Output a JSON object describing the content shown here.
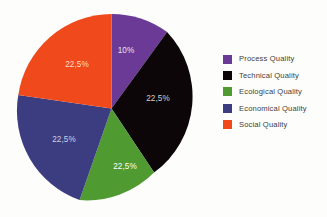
{
  "chart_data": {
    "type": "pie",
    "title": "",
    "subtitle": "",
    "xlabel": "",
    "ylabel": "",
    "grid": false,
    "legend_position": "right",
    "start_angle_deg": 0,
    "direction": "clockwise",
    "categories": [
      "Process Quality",
      "Technical Quality",
      "Ecological Quality",
      "Economical Quality",
      "Social Quality"
    ],
    "values": [
      10,
      22.5,
      22.5,
      22.5,
      22.5
    ],
    "value_unit": "%",
    "data_labels": [
      "10%",
      "22,5%",
      "22,5%",
      "22,5%",
      "22,5%"
    ],
    "colors": [
      "#6b3a96",
      "#0c0608",
      "#4f9a31",
      "#3c3c80",
      "#f04a1c"
    ],
    "label_colors": [
      "#e8e2ee",
      "#cfcfcf",
      "#ffffff",
      "#cfd0e4",
      "#ffd9c8"
    ],
    "slices": [
      {
        "name": "Process Quality",
        "label": "10%",
        "value": 10,
        "color": "#6b3a96",
        "label_color": "#e8e2ee",
        "path": "M 96.5 97.5 L 96.5 2.9 A 94.6 94.6 0 0 1 152.1 20.9 Z",
        "label_x": 111,
        "label_y": 42
      },
      {
        "name": "Technical Quality",
        "label": "22,5%",
        "value": 22.5,
        "color": "#0c0608",
        "label_color": "#cfcfcf",
        "path": "M 96.5 97.5 L 152.1 20.9 A 94.6 94.6 0 0 1 139.1 161.6 Z",
        "label_x": 143,
        "label_y": 90
      },
      {
        "name": "Ecological Quality",
        "label": "22,5%",
        "value": 22.5,
        "color": "#4f9a31",
        "label_color": "#ffffff",
        "path": "M 96.5 97.5 L 139.1 161.6 A 94.6 94.6 0 0 1 64.6 189.1 Z",
        "label_x": 110,
        "label_y": 158
      },
      {
        "name": "Economical Quality",
        "label": "22,5%",
        "value": 22.5,
        "color": "#3c3c80",
        "label_color": "#cfd0e4",
        "path": "M 96.5 97.5 L 64.6 189.1 A 94.6 94.6 0 0 1 3.3 84.0 Z",
        "label_x": 49,
        "label_y": 131
      },
      {
        "name": "Social Quality",
        "label": "22,5%",
        "value": 22.5,
        "color": "#f04a1c",
        "label_color": "#ffd9c8",
        "path": "M 96.5 97.5 L 3.3 84.0 A 94.6 94.6 0 0 1 96.5 2.9 Z",
        "label_x": 62,
        "label_y": 56
      }
    ]
  },
  "legend": {
    "items": [
      {
        "label": "Process Quality",
        "color": "#6b3a96"
      },
      {
        "label": "Technical Quality",
        "color": "#0c0608"
      },
      {
        "label": "Ecological Quality",
        "color": "#4f9a31"
      },
      {
        "label": "Economical Quality",
        "color": "#3c3c80"
      },
      {
        "label": "Social Quality",
        "color": "#f04a1c"
      }
    ]
  },
  "canvas": {
    "background": "#fdfdfb"
  }
}
